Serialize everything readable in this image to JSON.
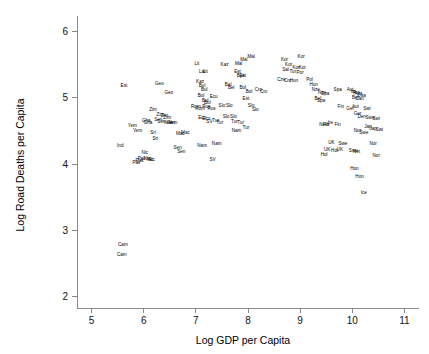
{
  "chart_data": {
    "type": "scatter",
    "title": "",
    "subtitle": "",
    "xlabel": "Log GDP per Capita",
    "ylabel": "Log Road Deaths per Capita",
    "xlim": [
      4.72,
      11.28
    ],
    "ylim": [
      1.82,
      6.18
    ],
    "xticks": [
      5,
      6,
      7,
      8,
      9,
      10,
      11
    ],
    "yticks": [
      2,
      3,
      4,
      5,
      6
    ],
    "xtick_labels": [
      "5",
      "6",
      "7",
      "8",
      "9",
      "10",
      "11"
    ],
    "ytick_labels": [
      "2",
      "3",
      "4",
      "5",
      "6"
    ],
    "grid": false,
    "legend": "none",
    "marker_style": "text-label",
    "marker_color": "#000000",
    "axis_color": "#8a8a8a",
    "point_label_field": "label",
    "points": [
      {
        "label": "Est",
        "x": 5.62,
        "y": 5.18
      },
      {
        "label": "Ind",
        "x": 5.55,
        "y": 4.28
      },
      {
        "label": "Cam",
        "x": 5.6,
        "y": 2.78
      },
      {
        "label": "Cam",
        "x": 5.58,
        "y": 2.63
      },
      {
        "label": "Yem",
        "x": 5.78,
        "y": 4.58
      },
      {
        "label": "Yem",
        "x": 5.88,
        "y": 4.5
      },
      {
        "label": "Pak",
        "x": 5.86,
        "y": 4.02
      },
      {
        "label": "Pak",
        "x": 5.92,
        "y": 4.05
      },
      {
        "label": "Pak",
        "x": 5.96,
        "y": 4.08
      },
      {
        "label": "Nic",
        "x": 6.02,
        "y": 4.17
      },
      {
        "label": "Nic",
        "x": 6.07,
        "y": 4.08
      },
      {
        "label": "Nic",
        "x": 6.12,
        "y": 4.07
      },
      {
        "label": "Nic",
        "x": 6.15,
        "y": 4.06
      },
      {
        "label": "Gha",
        "x": 6.05,
        "y": 4.66
      },
      {
        "label": "Gha",
        "x": 6.08,
        "y": 4.62
      },
      {
        "label": "Geo",
        "x": 6.3,
        "y": 5.22
      },
      {
        "label": "Geo",
        "x": 6.48,
        "y": 5.08
      },
      {
        "label": "Zim",
        "x": 6.18,
        "y": 4.82
      },
      {
        "label": "Zim",
        "x": 6.32,
        "y": 4.74
      },
      {
        "label": "Zim",
        "x": 6.4,
        "y": 4.73
      },
      {
        "label": "Sen",
        "x": 6.28,
        "y": 4.67
      },
      {
        "label": "Sen",
        "x": 6.34,
        "y": 4.64
      },
      {
        "label": "Sen",
        "x": 6.52,
        "y": 4.63
      },
      {
        "label": "Sri",
        "x": 6.18,
        "y": 4.48
      },
      {
        "label": "Sri",
        "x": 6.22,
        "y": 4.38
      },
      {
        "label": "Yem",
        "x": 6.46,
        "y": 4.62
      },
      {
        "label": "Yem",
        "x": 6.56,
        "y": 4.62
      },
      {
        "label": "Zim",
        "x": 6.45,
        "y": 4.7
      },
      {
        "label": "Mac",
        "x": 6.7,
        "y": 4.45
      },
      {
        "label": "Mac",
        "x": 6.8,
        "y": 4.47
      },
      {
        "label": "Sen",
        "x": 6.65,
        "y": 4.24
      },
      {
        "label": "Sen",
        "x": 6.72,
        "y": 4.18
      },
      {
        "label": "Kaz",
        "x": 7.08,
        "y": 5.24
      },
      {
        "label": "Lit",
        "x": 7.02,
        "y": 5.52
      },
      {
        "label": "Lat",
        "x": 7.12,
        "y": 5.4
      },
      {
        "label": "Lit",
        "x": 7.18,
        "y": 5.4
      },
      {
        "label": "Kaz",
        "x": 7.55,
        "y": 5.5
      },
      {
        "label": "Bul",
        "x": 7.12,
        "y": 5.18
      },
      {
        "label": "Bul",
        "x": 7.16,
        "y": 5.12
      },
      {
        "label": "Bul",
        "x": 7.1,
        "y": 5.04
      },
      {
        "label": "Bul",
        "x": 7.18,
        "y": 4.96
      },
      {
        "label": "Bul",
        "x": 7.22,
        "y": 4.92
      },
      {
        "label": "Ecu",
        "x": 7.34,
        "y": 5.02
      },
      {
        "label": "Rom",
        "x": 7.0,
        "y": 4.86
      },
      {
        "label": "Rom",
        "x": 7.08,
        "y": 4.84
      },
      {
        "label": "Rus",
        "x": 7.2,
        "y": 4.86
      },
      {
        "label": "Rus",
        "x": 7.3,
        "y": 4.84
      },
      {
        "label": "Ecu",
        "x": 7.12,
        "y": 4.7
      },
      {
        "label": "Ecu",
        "x": 7.2,
        "y": 4.68
      },
      {
        "label": "SV",
        "x": 7.26,
        "y": 4.64
      },
      {
        "label": "Tur",
        "x": 7.38,
        "y": 4.66
      },
      {
        "label": "Tur",
        "x": 7.46,
        "y": 4.62
      },
      {
        "label": "Slo",
        "x": 7.5,
        "y": 4.88
      },
      {
        "label": "Slo",
        "x": 7.64,
        "y": 4.88
      },
      {
        "label": "Slo",
        "x": 7.58,
        "y": 4.72
      },
      {
        "label": "Nam",
        "x": 7.12,
        "y": 4.28
      },
      {
        "label": "Nam",
        "x": 7.4,
        "y": 4.3
      },
      {
        "label": "SV",
        "x": 7.32,
        "y": 4.06
      },
      {
        "label": "Mal",
        "x": 7.82,
        "y": 5.52
      },
      {
        "label": "Mal",
        "x": 7.92,
        "y": 5.58
      },
      {
        "label": "Mal",
        "x": 8.06,
        "y": 5.62
      },
      {
        "label": "Est",
        "x": 7.8,
        "y": 5.4
      },
      {
        "label": "Est",
        "x": 7.9,
        "y": 5.34
      },
      {
        "label": "Bye",
        "x": 7.86,
        "y": 5.34
      },
      {
        "label": "Bel",
        "x": 7.62,
        "y": 5.2
      },
      {
        "label": "Bel",
        "x": 7.68,
        "y": 5.16
      },
      {
        "label": "Bol",
        "x": 7.9,
        "y": 5.16
      },
      {
        "label": "Bol",
        "x": 8.02,
        "y": 5.1
      },
      {
        "label": "Cro",
        "x": 8.2,
        "y": 5.12
      },
      {
        "label": "Cro",
        "x": 8.3,
        "y": 5.1
      },
      {
        "label": "Est",
        "x": 7.96,
        "y": 4.98
      },
      {
        "label": "Slo",
        "x": 8.06,
        "y": 4.88
      },
      {
        "label": "Slo",
        "x": 8.14,
        "y": 4.82
      },
      {
        "label": "Slo",
        "x": 7.72,
        "y": 4.72
      },
      {
        "label": "Tur",
        "x": 7.74,
        "y": 4.64
      },
      {
        "label": "Tur",
        "x": 7.86,
        "y": 4.62
      },
      {
        "label": "Tur",
        "x": 7.96,
        "y": 4.55
      },
      {
        "label": "Nam",
        "x": 7.78,
        "y": 4.5
      },
      {
        "label": "Kor",
        "x": 8.7,
        "y": 5.58
      },
      {
        "label": "Kor",
        "x": 9.02,
        "y": 5.62
      },
      {
        "label": "Kor",
        "x": 8.78,
        "y": 5.5
      },
      {
        "label": "Kor",
        "x": 8.92,
        "y": 5.46
      },
      {
        "label": "Kor",
        "x": 9.04,
        "y": 5.46
      },
      {
        "label": "Sal",
        "x": 8.72,
        "y": 5.42
      },
      {
        "label": "Tur",
        "x": 8.86,
        "y": 5.4
      },
      {
        "label": "Por",
        "x": 9.0,
        "y": 5.38
      },
      {
        "label": "Cze",
        "x": 8.64,
        "y": 5.28
      },
      {
        "label": "Cro",
        "x": 8.76,
        "y": 5.26
      },
      {
        "label": "Hun",
        "x": 8.88,
        "y": 5.26
      },
      {
        "label": "Pol",
        "x": 9.18,
        "y": 5.28
      },
      {
        "label": "Hun",
        "x": 9.26,
        "y": 5.2
      },
      {
        "label": "Nze",
        "x": 9.3,
        "y": 5.12
      },
      {
        "label": "Nze",
        "x": 9.42,
        "y": 5.08
      },
      {
        "label": "Spa",
        "x": 9.48,
        "y": 5.06
      },
      {
        "label": "Bel",
        "x": 9.34,
        "y": 4.98
      },
      {
        "label": "Spa",
        "x": 9.4,
        "y": 4.96
      },
      {
        "label": "Spa",
        "x": 9.72,
        "y": 5.12
      },
      {
        "label": "Aut",
        "x": 9.96,
        "y": 5.12
      },
      {
        "label": "Ita",
        "x": 10.02,
        "y": 5.1
      },
      {
        "label": "Fra",
        "x": 10.08,
        "y": 5.08
      },
      {
        "label": "Aus",
        "x": 10.12,
        "y": 5.06
      },
      {
        "label": "Usa",
        "x": 10.18,
        "y": 5.04
      },
      {
        "label": "Bel",
        "x": 10.06,
        "y": 5.0
      },
      {
        "label": "Can",
        "x": 10.14,
        "y": 4.98
      },
      {
        "label": "Fin",
        "x": 9.78,
        "y": 4.86
      },
      {
        "label": "Ger",
        "x": 9.96,
        "y": 4.84
      },
      {
        "label": "Aut",
        "x": 10.06,
        "y": 4.86
      },
      {
        "label": "Swi",
        "x": 10.28,
        "y": 4.84
      },
      {
        "label": "Ger",
        "x": 10.1,
        "y": 4.76
      },
      {
        "label": "Den",
        "x": 10.18,
        "y": 4.72
      },
      {
        "label": "Swe",
        "x": 10.34,
        "y": 4.7
      },
      {
        "label": "Swi",
        "x": 10.46,
        "y": 4.68
      },
      {
        "label": "Ire",
        "x": 9.58,
        "y": 4.62
      },
      {
        "label": "Fin",
        "x": 9.72,
        "y": 4.6
      },
      {
        "label": "Neth",
        "x": 9.46,
        "y": 4.6
      },
      {
        "label": "Fin",
        "x": 9.5,
        "y": 4.6
      },
      {
        "label": "Jap",
        "x": 10.3,
        "y": 4.56
      },
      {
        "label": "Jap",
        "x": 10.4,
        "y": 4.54
      },
      {
        "label": "Swi",
        "x": 10.52,
        "y": 4.52
      },
      {
        "label": "Nor",
        "x": 10.1,
        "y": 4.5
      },
      {
        "label": "Swe",
        "x": 10.22,
        "y": 4.48
      },
      {
        "label": "UK",
        "x": 9.6,
        "y": 4.32
      },
      {
        "label": "Swe",
        "x": 9.82,
        "y": 4.3
      },
      {
        "label": "Nor",
        "x": 10.4,
        "y": 4.3
      },
      {
        "label": "UK",
        "x": 9.52,
        "y": 4.22
      },
      {
        "label": "Hol",
        "x": 9.66,
        "y": 4.2
      },
      {
        "label": "UK",
        "x": 9.76,
        "y": 4.22
      },
      {
        "label": "Swe",
        "x": 10.02,
        "y": 4.2
      },
      {
        "label": "Net",
        "x": 10.08,
        "y": 4.18
      },
      {
        "label": "Hol",
        "x": 9.46,
        "y": 4.14
      },
      {
        "label": "Nor",
        "x": 10.46,
        "y": 4.12
      },
      {
        "label": "Hon",
        "x": 10.04,
        "y": 3.92
      },
      {
        "label": "Hon",
        "x": 10.14,
        "y": 3.8
      },
      {
        "label": "Ice",
        "x": 10.22,
        "y": 3.56
      }
    ]
  },
  "axes": {
    "x_title": "Log GDP per Capita",
    "y_title": "Log Road Deaths per Capita"
  }
}
